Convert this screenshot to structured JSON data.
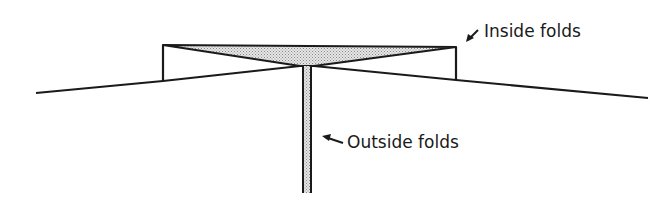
{
  "diagram": {
    "title": "",
    "labels": {
      "inside": "Inside folds",
      "outside": "Outside folds"
    },
    "colors": {
      "stroke": "#1a1a1a",
      "fill": "#c8c8c8",
      "background": "#ffffff"
    }
  }
}
